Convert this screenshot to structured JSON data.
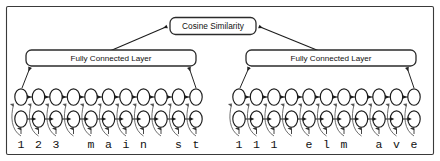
{
  "figure": {
    "border_color": "#3a3a3a",
    "background": "#ffffff"
  },
  "top_node": {
    "label": "Cosine Similarity",
    "box_fill": "#ffffff",
    "box_stroke": "#2b2b2b"
  },
  "branches": [
    {
      "id": "left",
      "fc_label": "Fully Connected Layer",
      "sequence_label": "123 main st",
      "characters": [
        "1",
        "2",
        "3",
        " ",
        "m",
        "a",
        "i",
        "n",
        " ",
        "s",
        "t"
      ],
      "timesteps": 11
    },
    {
      "id": "right",
      "fc_label": "Fully Connected Layer",
      "sequence_label": "111 elm ave",
      "characters": [
        "1",
        "1",
        "1",
        " ",
        "e",
        "l",
        "m",
        " ",
        "a",
        "v",
        "e"
      ],
      "timesteps": 11
    }
  ],
  "rnn": {
    "top_row_direction": "backward",
    "bottom_row_direction": "forward",
    "node_shape": "ellipse",
    "node_fill": "#ffffff",
    "node_stroke": "#1c1c1c",
    "rows": 2
  },
  "colors": {
    "line": "#1c1c1c",
    "curve": "#555555",
    "text": "#111111"
  }
}
